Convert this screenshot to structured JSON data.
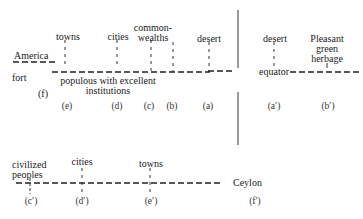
{
  "diagram": {
    "type": "map-schematic",
    "upper_section": {
      "left_line_label": "America",
      "left_below": "fort",
      "left_paren": "(f)",
      "main_line_caption": [
        "populous with excellent",
        "institutions"
      ],
      "center_label": "equator",
      "items_left": [
        {
          "text": [
            "towns"
          ],
          "marker": "(e)"
        },
        {
          "text": [
            "cities"
          ],
          "marker": "(d)"
        },
        {
          "text": [
            "common-",
            "wealths"
          ],
          "marker": "(c)"
        },
        {
          "text": [
            ""
          ],
          "marker": "(b)"
        },
        {
          "text": [
            "desert"
          ],
          "marker": "(a)"
        }
      ],
      "items_right": [
        {
          "text": [
            "desert"
          ],
          "marker": "(a′)"
        },
        {
          "text": [
            "Pleasant",
            "green",
            "herbage"
          ],
          "marker": "(b′)"
        }
      ]
    },
    "lower_section": {
      "items": [
        {
          "text": [
            "civilized",
            "peoples"
          ],
          "marker": "(c′)"
        },
        {
          "text": [
            "cities"
          ],
          "marker": "(d′)"
        },
        {
          "text": [
            "towns"
          ],
          "marker": "(e′)"
        }
      ],
      "end_label": "Ceylon",
      "end_marker": "(f′)"
    }
  }
}
